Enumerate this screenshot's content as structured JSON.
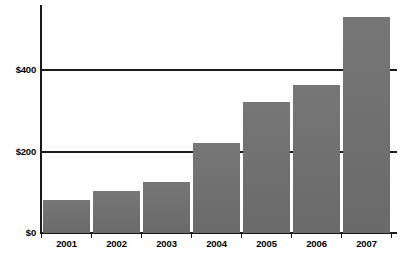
{
  "chart_data": {
    "type": "bar",
    "title": "",
    "subtitle": "",
    "xlabel": "",
    "ylabel": "",
    "categories": [
      "2001",
      "2002",
      "2003",
      "2004",
      "2005",
      "2006",
      "2007"
    ],
    "values": [
      80,
      102,
      124,
      220,
      320,
      361,
      527
    ],
    "series": [
      {
        "name": "",
        "values": [
          80,
          102,
          124,
          220,
          320,
          361,
          527
        ]
      }
    ],
    "ylim": [
      0,
      560
    ],
    "yticks": [
      0,
      200,
      400
    ],
    "ytick_labels": [
      "$0",
      "$200",
      "$400"
    ],
    "grid": true,
    "grid_axis": "y",
    "legend": false,
    "legend_position": "none",
    "bar_color": "#6e6e6e",
    "axis_color": "#1a1a1a",
    "background_color": "#ffffff",
    "annotations": []
  },
  "axis": {
    "y_labels": {
      "zero": "$0",
      "two_hundred": "$200",
      "four_hundred": "$400"
    }
  },
  "bars": [
    {
      "label": "2001",
      "value": 80,
      "left": 43,
      "width": 47
    },
    {
      "label": "2002",
      "value": 102,
      "left": 93,
      "width": 47
    },
    {
      "label": "2003",
      "value": 124,
      "left": 143,
      "width": 47
    },
    {
      "label": "2004",
      "value": 220,
      "left": 193,
      "width": 47
    },
    {
      "label": "2005",
      "value": 320,
      "left": 243,
      "width": 47
    },
    {
      "label": "2006",
      "value": 361,
      "left": 293,
      "width": 47
    },
    {
      "label": "2007",
      "value": 527,
      "left": 343,
      "width": 47
    }
  ]
}
